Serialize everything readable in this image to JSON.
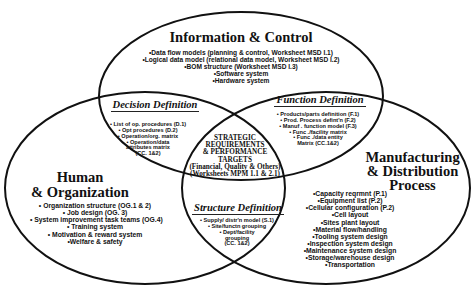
{
  "diagram": {
    "info_control": {
      "title": "Information & Control",
      "items": [
        "•Data flow models (planning & control, Worksheet MSD I.1)",
        "•Logical data model (relational data model, Worksheet MSD I.2)",
        "•BOM structure (Worksheet MSD I.3)",
        "•Software system",
        "•Hardware system"
      ]
    },
    "human_org": {
      "title_line1": "Human",
      "title_line2": "& Organization",
      "items": [
        "• Organization structure (OG.1 & 2)",
        "• Job design (OG. 3)",
        "• System improvement task teams (OG.4)",
        "• Training system",
        "• Motivation & reward system",
        "•Welfare & safety"
      ]
    },
    "manufacturing": {
      "title_line1": "Manufacturing",
      "title_line2": "& Distribution",
      "title_line3": "Process",
      "items": [
        "•Capacity reqrmnt (P.1)",
        "•Equipment list (P.2)",
        "•Cellular configuration (P.2)",
        "•Cell layout",
        "•Sites plant layout",
        "•Material flow/handling",
        "•Tooling system design",
        "•Inspection system design",
        "•Maintenance system design",
        "•Storage/warehouse design",
        "•Transportation"
      ]
    },
    "decision": {
      "title": "Decision Definition",
      "items": [
        "• List of op. procedures (D.1)",
        "• Opt procedures (D.2)",
        "• Operation/org. matrix",
        "• Operation/data",
        "attributes matrix",
        "(CC. 1&2)"
      ]
    },
    "function": {
      "title": "Function Definition",
      "items": [
        "• Products/parts definition (F.1)",
        "• Prod. Process  defint'n (F.2)",
        "• Manuf . function model (F.3)",
        "• Func ./facility matrix",
        "• Func ./data entity",
        "Matrix (CC.1&2)"
      ]
    },
    "structure": {
      "title": "Structure Definition",
      "items": [
        "• Supply/ distr'n model (S.1)",
        "• Site/functn  grouping",
        "• Dept/facility",
        "grouping",
        "(CC. 1&2)"
      ]
    },
    "center": {
      "lines": [
        "STRATEGIC",
        "REQUIREMENTS",
        "& PERFORMANCE",
        "TARGETS",
        "(Financial, Quality & Others)",
        "(Worksheets MPM 1.1 & 2.1)"
      ]
    },
    "colors": {
      "stroke": "#111111",
      "text": "#111111",
      "background": "#ffffff"
    }
  }
}
